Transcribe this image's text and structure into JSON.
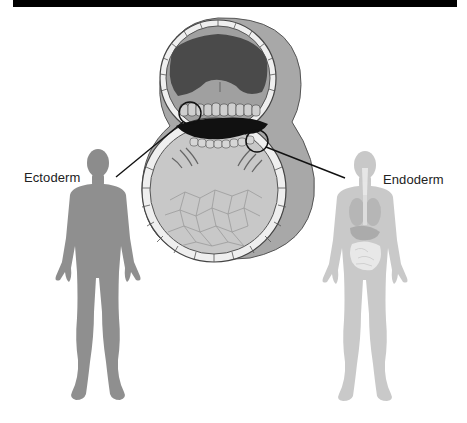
{
  "figure": {
    "type": "embryo germ layer diagram",
    "labels": {
      "left": "Ectoderm",
      "right": "Endoderm"
    },
    "colors": {
      "top_bar": "#000000",
      "background": "#ffffff",
      "ectoderm_figure": "#8a8a8a",
      "endoderm_figure": "#c4c4c4",
      "amniotic_cavity": "#4a4a4a",
      "yolk_sac": "#c8c8c8",
      "outer_shell": "#a8a8a8",
      "cell_layer": "#efefef",
      "embryonic_disc": "#111111",
      "callout_line": "#111111"
    },
    "callouts": [
      {
        "label_ref": "left",
        "target": "upper-layer-cells (epiblast)"
      },
      {
        "label_ref": "right",
        "target": "lower-layer-cells (hypoblast)"
      }
    ]
  }
}
